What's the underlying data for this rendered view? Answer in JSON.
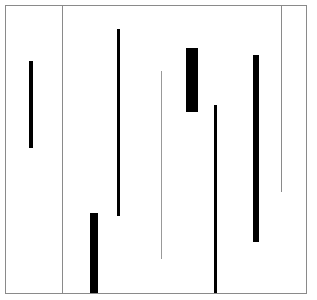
{
  "diagram": {
    "type": "vertical-segments",
    "background": "#ffffff",
    "frame": {
      "left": 5,
      "top": 5,
      "width": 300,
      "height": 287,
      "color": "#8a8a8a"
    },
    "segments": [
      {
        "name": "divider-line",
        "x": 62,
        "y": 5,
        "w": 1,
        "h": 288,
        "color": "#8a8a8a"
      },
      {
        "name": "bar-1",
        "x": 29,
        "y": 61,
        "w": 4,
        "h": 87,
        "color": "#000000"
      },
      {
        "name": "bar-2",
        "x": 117,
        "y": 29,
        "w": 3,
        "h": 187,
        "color": "#000000"
      },
      {
        "name": "bar-3",
        "x": 90,
        "y": 213,
        "w": 8,
        "h": 80,
        "color": "#000000"
      },
      {
        "name": "thin-line-1",
        "x": 161,
        "y": 71,
        "w": 1,
        "h": 188,
        "color": "#999999"
      },
      {
        "name": "block-1",
        "x": 186,
        "y": 48,
        "w": 12,
        "h": 64,
        "color": "#000000"
      },
      {
        "name": "bar-4",
        "x": 214,
        "y": 105,
        "w": 3,
        "h": 188,
        "color": "#000000"
      },
      {
        "name": "bar-5",
        "x": 253,
        "y": 55,
        "w": 6,
        "h": 187,
        "color": "#000000"
      },
      {
        "name": "thin-line-2",
        "x": 281,
        "y": 5,
        "w": 1,
        "h": 187,
        "color": "#8a8a8a"
      }
    ]
  }
}
